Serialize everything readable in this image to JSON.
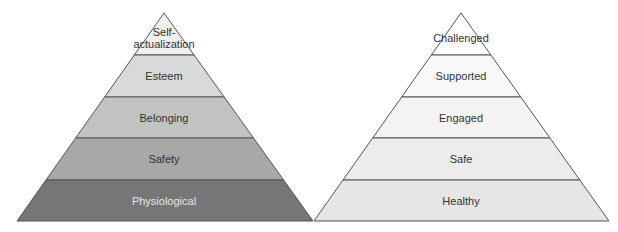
{
  "diagram": {
    "type": "two-pyramids",
    "left_pyramid": {
      "name": "Maslow's hierarchy of needs",
      "levels_top_to_bottom": [
        {
          "label": "Self-\nactualization",
          "fill": "#efefef",
          "text_color": "#333333"
        },
        {
          "label": "Esteem",
          "fill": "#d9d9d9",
          "text_color": "#333333"
        },
        {
          "label": "Belonging",
          "fill": "#c2c2c2",
          "text_color": "#333333"
        },
        {
          "label": "Safety",
          "fill": "#a8a8a8",
          "text_color": "#333333"
        },
        {
          "label": "Physiological",
          "fill": "#767676",
          "text_color": "#e6e6e6"
        }
      ]
    },
    "right_pyramid": {
      "levels_top_to_bottom": [
        {
          "label": "Challenged",
          "fill": "#ffffff",
          "text_color": "#333333"
        },
        {
          "label": "Supported",
          "fill": "#f9f9f9",
          "text_color": "#333333"
        },
        {
          "label": "Engaged",
          "fill": "#f3f3f3",
          "text_color": "#333333"
        },
        {
          "label": "Safe",
          "fill": "#ececec",
          "text_color": "#333333"
        },
        {
          "label": "Healthy",
          "fill": "#e6e6e6",
          "text_color": "#333333"
        }
      ]
    },
    "stroke_color": "#555555"
  }
}
